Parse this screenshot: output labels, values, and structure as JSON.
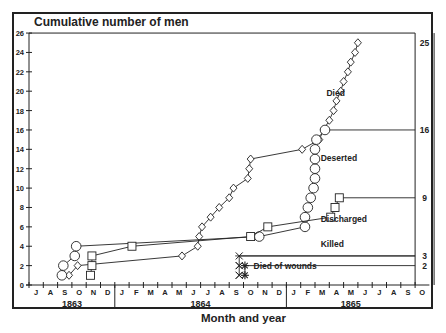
{
  "chart_data": {
    "type": "line",
    "title": "Cumulative number of men",
    "xlabel": "Month and year",
    "ylabel": "Cumulative number of men",
    "ylim": [
      0,
      26
    ],
    "yticks": [
      0,
      2,
      4,
      6,
      8,
      10,
      12,
      14,
      16,
      18,
      20,
      22,
      24,
      26
    ],
    "x_unit": "months since 1 July 1863",
    "month_ticks": [
      "J",
      "A",
      "S",
      "O",
      "N",
      "D",
      "J",
      "F",
      "M",
      "A",
      "M",
      "J",
      "J",
      "A",
      "S",
      "O",
      "N",
      "D",
      "J",
      "F",
      "M",
      "A",
      "M",
      "J",
      "J",
      "A",
      "S",
      "O"
    ],
    "years": [
      {
        "label": "1863",
        "center_month": 3
      },
      {
        "label": "1864",
        "center_month": 12
      },
      {
        "label": "1865",
        "center_month": 22.5
      }
    ],
    "year_dividers": [
      6,
      18
    ],
    "grid": false,
    "series": [
      {
        "name": "Died",
        "marker": "diamond",
        "final_value": 25,
        "points": [
          [
            2.8,
            1
          ],
          [
            3.4,
            2
          ],
          [
            10.7,
            3
          ],
          [
            11.8,
            4
          ],
          [
            11.9,
            5
          ],
          [
            12.1,
            6
          ],
          [
            12.7,
            7
          ],
          [
            13.3,
            8
          ],
          [
            14.0,
            9
          ],
          [
            14.3,
            10
          ],
          [
            15.3,
            11
          ],
          [
            15.4,
            12
          ],
          [
            15.5,
            13
          ],
          [
            19.1,
            14
          ],
          [
            20.3,
            15
          ],
          [
            20.6,
            16
          ],
          [
            21.0,
            17
          ],
          [
            21.3,
            18
          ],
          [
            21.5,
            19
          ],
          [
            21.8,
            20
          ],
          [
            22.0,
            21
          ],
          [
            22.3,
            22
          ],
          [
            22.5,
            23
          ],
          [
            22.8,
            24
          ],
          [
            23.0,
            25
          ]
        ],
        "label_pos": [
          20.8,
          19.5
        ]
      },
      {
        "name": "Deserted",
        "marker": "circle",
        "final_value": 16,
        "points": [
          [
            2.3,
            1
          ],
          [
            2.4,
            2
          ],
          [
            3.2,
            3
          ],
          [
            3.3,
            4
          ],
          [
            16.1,
            5
          ],
          [
            19.3,
            6
          ],
          [
            19.3,
            7
          ],
          [
            19.5,
            8
          ],
          [
            19.7,
            9
          ],
          [
            19.9,
            10
          ],
          [
            20.0,
            11
          ],
          [
            20.0,
            12
          ],
          [
            20.0,
            13
          ],
          [
            20.0,
            14
          ],
          [
            20.1,
            15
          ],
          [
            20.7,
            16
          ]
        ],
        "label_pos": [
          20.4,
          12.8
        ]
      },
      {
        "name": "Discharged",
        "marker": "square",
        "final_value": 9,
        "points": [
          [
            4.3,
            1
          ],
          [
            4.4,
            2
          ],
          [
            4.4,
            3
          ],
          [
            7.2,
            4
          ],
          [
            15.5,
            5
          ],
          [
            16.7,
            6
          ],
          [
            21.1,
            7
          ],
          [
            21.4,
            8
          ],
          [
            21.7,
            9
          ]
        ],
        "label_pos": [
          20.4,
          6.5
        ]
      },
      {
        "name": "Killed",
        "marker": "x",
        "final_value": 3,
        "points": [
          [
            14.7,
            1
          ],
          [
            14.7,
            2
          ],
          [
            14.7,
            3
          ]
        ],
        "label_pos": [
          20.4,
          3.9
        ]
      },
      {
        "name": "Died of wounds",
        "marker": "star",
        "final_value": 2,
        "points": [
          [
            15.1,
            1
          ],
          [
            15.1,
            2
          ]
        ],
        "label_pos": [
          15.7,
          1.7
        ]
      }
    ],
    "end_month": 27,
    "annotations": [
      "25",
      "16",
      "9",
      "3",
      "2"
    ]
  }
}
